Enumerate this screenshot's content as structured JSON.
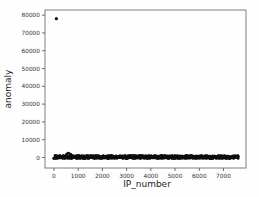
{
  "figure": {
    "background": "#fefefe",
    "frame_color": "#7f7f7f",
    "tick_color": "#4d4d4d"
  },
  "chart_data": {
    "type": "scatter",
    "title": "",
    "xlabel": "IP_number",
    "ylabel": "anomaly",
    "xticks": [
      0,
      1000,
      2000,
      3000,
      4000,
      5000,
      6000,
      7000
    ],
    "yticks": [
      0,
      10000,
      20000,
      30000,
      40000,
      50000,
      60000,
      70000,
      80000
    ],
    "xlim": [
      -370,
      7930
    ],
    "ylim": [
      -5900,
      82900
    ],
    "grid": false,
    "legend": null,
    "marker_color": "#0d0d0d",
    "outlier_point": {
      "x": 100,
      "y": 78000
    },
    "bump_points": [
      [
        520,
        1900
      ],
      [
        580,
        2500
      ],
      [
        640,
        2200
      ],
      [
        700,
        1800
      ]
    ],
    "dense_band": {
      "x_min": 0,
      "x_max": 7600,
      "y_min": -600,
      "y_max": 1100,
      "count": 900,
      "description": "dense cluster of near-zero anomaly values across all IP numbers"
    }
  }
}
